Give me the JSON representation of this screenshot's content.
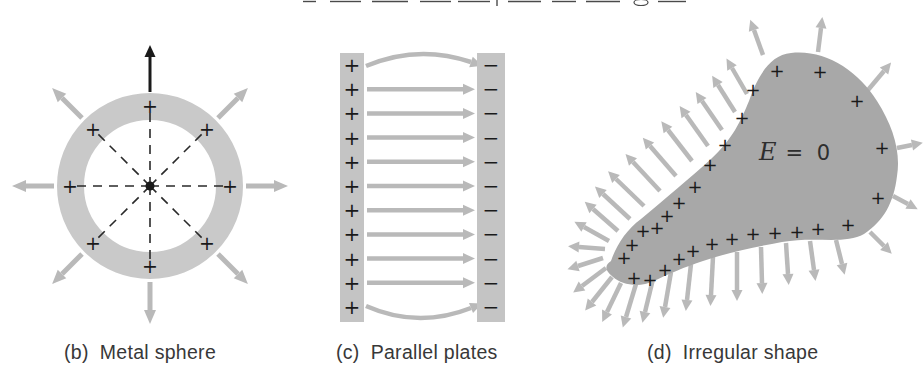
{
  "figure": {
    "panels": [
      "metal-sphere",
      "parallel-plates",
      "irregular-shape"
    ]
  },
  "colors": {
    "background": "#ffffff",
    "conductor_light": "#c9c9c9",
    "plate": "#c4c4c4",
    "conductor_dark": "#a8a8a8",
    "arrow": "#b9b9b9",
    "charge": "#1a1a1a",
    "dashed": "#2a2a2a",
    "label": "#383838",
    "cropped_text": "#4a4a4a"
  },
  "captions": {
    "b": {
      "prefix": "(b)",
      "text": "Metal sphere"
    },
    "c": {
      "prefix": "(c)",
      "text": "Parallel plates"
    },
    "d": {
      "prefix": "(d)",
      "text": "Irregular shape"
    }
  },
  "cropped_caption": {
    "segments": [
      [
        303,
        1.5,
        316,
        1.5
      ],
      [
        330,
        1.5,
        361,
        1.5
      ],
      [
        372,
        1.5,
        408,
        1.5
      ],
      [
        420,
        1.5,
        451,
        1.5
      ],
      [
        458,
        1.5,
        490,
        1.5
      ],
      [
        497,
        0,
        497,
        6
      ],
      [
        508,
        1.5,
        541,
        1.5
      ],
      [
        552,
        1.5,
        576,
        1.5
      ],
      [
        586,
        1.5,
        620,
        1.5
      ],
      [
        658,
        1.5,
        686,
        1.5
      ]
    ],
    "loop": {
      "cx": 641,
      "cy": 2.5,
      "rx": 7,
      "ry": 3
    }
  },
  "sphere": {
    "center": {
      "x": 150,
      "y": 186
    },
    "outer_radius": 93,
    "inner_radius": 66,
    "center_dot_radius": 4.5,
    "charge_sign": "+",
    "plus_positions": [
      [
        150,
        106
      ],
      [
        207,
        129
      ],
      [
        230,
        186
      ],
      [
        207,
        243
      ],
      [
        150,
        266
      ],
      [
        93,
        243
      ],
      [
        70,
        186
      ],
      [
        93,
        129
      ]
    ],
    "dashed_lines": [
      [
        150,
        186,
        150,
        110
      ],
      [
        150,
        186,
        204,
        132
      ],
      [
        150,
        186,
        226,
        186
      ],
      [
        150,
        186,
        204,
        240
      ],
      [
        150,
        186,
        150,
        262
      ],
      [
        150,
        186,
        96,
        240
      ],
      [
        150,
        186,
        74,
        186
      ],
      [
        150,
        186,
        96,
        132
      ]
    ],
    "arrows": [
      {
        "x1": 150,
        "y1": 92,
        "x2": 150,
        "y2": 57,
        "color": "#1a1a1a",
        "width": 3,
        "hl": 12,
        "hw": 5.5
      },
      {
        "x1": 218,
        "y1": 118,
        "x2": 238,
        "y2": 98
      },
      {
        "x1": 246,
        "y1": 186,
        "x2": 274,
        "y2": 186
      },
      {
        "x1": 218,
        "y1": 254,
        "x2": 238,
        "y2": 274
      },
      {
        "x1": 150,
        "y1": 282,
        "x2": 150,
        "y2": 310
      },
      {
        "x1": 82,
        "y1": 254,
        "x2": 62,
        "y2": 274
      },
      {
        "x1": 54,
        "y1": 186,
        "x2": 26,
        "y2": 186
      },
      {
        "x1": 82,
        "y1": 118,
        "x2": 62,
        "y2": 98
      }
    ]
  },
  "plates": {
    "left_plate": {
      "x": 340,
      "y": 53,
      "w": 24,
      "h": 269
    },
    "right_plate": {
      "x": 477,
      "y": 53,
      "w": 28,
      "h": 269
    },
    "plus_sign": "+",
    "minus_sign": "−",
    "plus_x": 352,
    "minus_x": 491,
    "row_ys": [
      65,
      89.2,
      113.4,
      137.6,
      161.8,
      186,
      210.2,
      234.4,
      258.6,
      282.8,
      307
    ],
    "arrows": [
      {
        "x1": 366,
        "y1": 66,
        "cx": 418,
        "cy": 44,
        "x2": 471,
        "y2": 62
      },
      {
        "x1": 367,
        "y1": 89.2,
        "x2": 463,
        "y2": 89.2
      },
      {
        "x1": 367,
        "y1": 113.4,
        "x2": 463,
        "y2": 113.4
      },
      {
        "x1": 367,
        "y1": 137.6,
        "x2": 463,
        "y2": 137.6
      },
      {
        "x1": 367,
        "y1": 161.8,
        "x2": 463,
        "y2": 161.8
      },
      {
        "x1": 367,
        "y1": 186,
        "x2": 463,
        "y2": 186
      },
      {
        "x1": 367,
        "y1": 210.2,
        "x2": 463,
        "y2": 210.2
      },
      {
        "x1": 367,
        "y1": 234.4,
        "x2": 463,
        "y2": 234.4
      },
      {
        "x1": 367,
        "y1": 258.6,
        "x2": 463,
        "y2": 258.6
      },
      {
        "x1": 367,
        "y1": 282.8,
        "x2": 463,
        "y2": 282.8
      },
      {
        "x1": 366,
        "y1": 306,
        "cx": 418,
        "cy": 329,
        "x2": 471,
        "y2": 308
      }
    ]
  },
  "blob": {
    "field_symbol": "E",
    "field_rest": "= 0",
    "charge_sign": "+",
    "path": "M 611 261 C 616 246 626 230 641 219 C 666 198 690 178 711 159 C 733 139 741 120 749 101 C 757 78 769 55 791 53 C 824 49 858 70 877 101 C 893 126 901 152 897 176 C 894 202 884 221 864 234 C 845 245 815 236 782 242 C 755 247 730 252 703 261 C 685 267 668 274 654 281 C 639 288 622 285 613 277 C 604 270 605 265 611 261 Z",
    "plus_positions": [
      [
        777,
        70
      ],
      [
        820,
        71
      ],
      [
        753,
        89
      ],
      [
        857,
        100
      ],
      [
        742,
        117
      ],
      [
        725,
        144
      ],
      [
        882,
        147
      ],
      [
        710,
        164
      ],
      [
        695,
        186
      ],
      [
        878,
        197
      ],
      [
        679,
        202
      ],
      [
        667,
        215
      ],
      [
        657,
        227
      ],
      [
        643,
        230
      ],
      [
        632,
        244
      ],
      [
        624,
        257
      ],
      [
        634,
        277
      ],
      [
        650,
        279
      ],
      [
        665,
        269
      ],
      [
        679,
        258
      ],
      [
        693,
        250
      ],
      [
        712,
        243
      ],
      [
        732,
        238
      ],
      [
        753,
        233
      ],
      [
        775,
        232
      ],
      [
        797,
        231
      ],
      [
        818,
        228
      ],
      [
        848,
        224
      ]
    ],
    "arrows": [
      {
        "x1": 763,
        "y1": 55,
        "x2": 754,
        "y2": 30
      },
      {
        "x1": 818,
        "y1": 52,
        "x2": 821,
        "y2": 28
      },
      {
        "x1": 868,
        "y1": 90,
        "x2": 884,
        "y2": 71
      },
      {
        "x1": 897,
        "y1": 148,
        "x2": 912,
        "y2": 145
      },
      {
        "x1": 893,
        "y1": 196,
        "x2": 908,
        "y2": 204
      },
      {
        "x1": 870,
        "y1": 232,
        "x2": 884,
        "y2": 246
      },
      {
        "x1": 836,
        "y1": 240,
        "x2": 842,
        "y2": 264
      },
      {
        "x1": 810,
        "y1": 241,
        "x2": 814,
        "y2": 270
      },
      {
        "x1": 786,
        "y1": 243,
        "x2": 788,
        "y2": 274
      },
      {
        "x1": 761,
        "y1": 247,
        "x2": 762,
        "y2": 283
      },
      {
        "x1": 737,
        "y1": 252,
        "x2": 737,
        "y2": 290
      },
      {
        "x1": 713,
        "y1": 257,
        "x2": 711,
        "y2": 295
      },
      {
        "x1": 691,
        "y1": 264,
        "x2": 687,
        "y2": 300
      },
      {
        "x1": 671,
        "y1": 272,
        "x2": 665,
        "y2": 307
      },
      {
        "x1": 653,
        "y1": 279,
        "x2": 645,
        "y2": 312
      },
      {
        "x1": 636,
        "y1": 284,
        "x2": 626,
        "y2": 317
      },
      {
        "x1": 621,
        "y1": 283,
        "x2": 607,
        "y2": 312
      },
      {
        "x1": 612,
        "y1": 277,
        "x2": 592,
        "y2": 302
      },
      {
        "x1": 606,
        "y1": 268,
        "x2": 582,
        "y2": 286
      },
      {
        "x1": 603,
        "y1": 258,
        "x2": 578,
        "y2": 266
      },
      {
        "x1": 605,
        "y1": 249,
        "x2": 579,
        "y2": 247
      },
      {
        "x1": 609,
        "y1": 241,
        "x2": 584,
        "y2": 227
      },
      {
        "x1": 618,
        "y1": 231,
        "x2": 593,
        "y2": 209
      },
      {
        "x1": 630,
        "y1": 219,
        "x2": 603,
        "y2": 194
      },
      {
        "x1": 644,
        "y1": 206,
        "x2": 616,
        "y2": 179
      },
      {
        "x1": 660,
        "y1": 191,
        "x2": 633,
        "y2": 162
      },
      {
        "x1": 676,
        "y1": 176,
        "x2": 650,
        "y2": 146
      },
      {
        "x1": 692,
        "y1": 161,
        "x2": 668,
        "y2": 130
      },
      {
        "x1": 708,
        "y1": 146,
        "x2": 686,
        "y2": 115
      },
      {
        "x1": 722,
        "y1": 130,
        "x2": 702,
        "y2": 101
      },
      {
        "x1": 735,
        "y1": 112,
        "x2": 718,
        "y2": 85
      },
      {
        "x1": 747,
        "y1": 94,
        "x2": 732,
        "y2": 68
      }
    ]
  }
}
